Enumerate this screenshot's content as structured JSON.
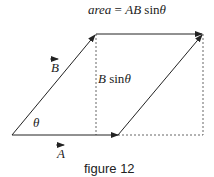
{
  "title_formula": {
    "lhs": "area",
    "eq": " = ",
    "rhs_AB": "AB",
    "rhs_sin": " sin",
    "rhs_theta": "θ"
  },
  "labels": {
    "vector_B": "B",
    "vector_A": "A",
    "height_B": "B",
    "height_sin": " sin",
    "height_theta": "θ",
    "angle": "θ"
  },
  "caption": "figure 12",
  "colors": {
    "line": "#222222",
    "dashed": "#555555"
  }
}
